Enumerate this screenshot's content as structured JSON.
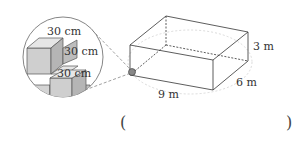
{
  "figure": {
    "magnifier": {
      "labels": [
        "30 cm",
        "30 cm",
        "30 cm"
      ],
      "cube_colors": {
        "front": "#cfcfcf",
        "top": "#e6e6e6",
        "side": "#b5b5b5"
      }
    },
    "box": {
      "length_label": "9 m",
      "width_label": "6 m",
      "height_label": "3 m"
    }
  },
  "answer": {
    "open_paren": "(",
    "close_paren": ")",
    "value": ""
  }
}
